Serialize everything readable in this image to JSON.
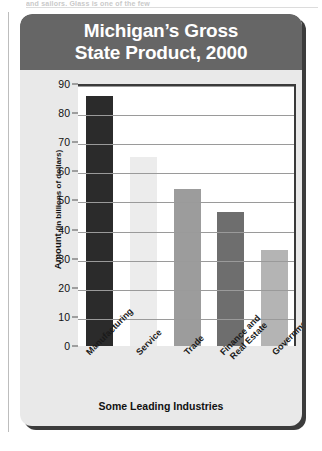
{
  "page": {
    "clipped_top_text": "and sailors. Glass is one of the few"
  },
  "figure": {
    "title": "Michigan’s Gross State Product, 2000",
    "title_line1": "Michigan’s Gross",
    "title_line2": "State Product, 2000",
    "title_bar_color": "#666666",
    "panel_color": "#e9e9e9",
    "plot_color": "#ffffff"
  },
  "chart_data": {
    "type": "bar",
    "title": "Michigan’s Gross State Product, 2000",
    "xlabel": "Some Leading Industries",
    "ylabel": "Amount (in billions of dollars)",
    "ylabel_main": "Amount",
    "ylabel_paren": "(in billions of dollars)",
    "categories": [
      "Manufacturing",
      "Service",
      "Trade",
      "Finance and Real Estate",
      "Government"
    ],
    "category_lines": [
      [
        "Manufacturing"
      ],
      [
        "Service"
      ],
      [
        "Trade"
      ],
      [
        "Finance and",
        "Real Estate"
      ],
      [
        "Government"
      ]
    ],
    "values": [
      86,
      65,
      54,
      46,
      33
    ],
    "bar_colors": [
      "#2b2b2b",
      "#ececec",
      "#9c9c9c",
      "#6e6e6e",
      "#b4b4b4"
    ],
    "ylim": [
      0,
      90
    ],
    "yticks": [
      0,
      10,
      20,
      30,
      40,
      50,
      60,
      70,
      80,
      90
    ],
    "ytick_labels": [
      "0",
      "10",
      "20",
      "30",
      "40",
      "50",
      "60",
      "70",
      "80",
      "90"
    ],
    "grid": true,
    "grid_axis": "y",
    "legend": "none"
  }
}
